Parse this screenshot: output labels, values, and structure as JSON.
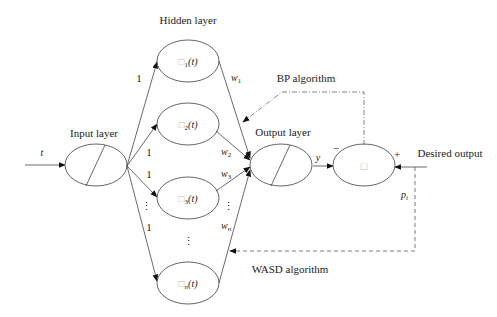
{
  "diagram": {
    "labels": {
      "hidden_layer": "Hidden layer",
      "input_layer": "Input layer",
      "output_layer": "Output layer",
      "bp_algorithm": "BP algorithm",
      "wasd_algorithm": "WASD algorithm",
      "desired_output": "Desired output"
    },
    "input_signal": "t",
    "output_signal": "y",
    "desired_signal": "p",
    "desired_signal_sub": "i",
    "error_node": {
      "symbol": "□",
      "minus_sign": "−",
      "plus_sign": "+"
    },
    "hidden_nodes": [
      {
        "label": "□",
        "sub": "1",
        "arg": "(t)"
      },
      {
        "label": "□",
        "sub": "2",
        "arg": "(t)"
      },
      {
        "label": "□",
        "sub": "3",
        "arg": "(t)"
      },
      {
        "label": "□",
        "sub": "n",
        "arg": "(t)"
      }
    ],
    "hidden_ellipsis": "⋮",
    "input_weights": [
      "1",
      "1",
      "1",
      "1"
    ],
    "input_weights_ellipsis": "⋮",
    "output_weights": [
      {
        "w": "w",
        "sub": "1"
      },
      {
        "w": "w",
        "sub": "2"
      },
      {
        "w": "w",
        "sub": "3"
      },
      {
        "w": "w",
        "sub": "n"
      }
    ],
    "output_weights_ellipsis": "⋮"
  }
}
